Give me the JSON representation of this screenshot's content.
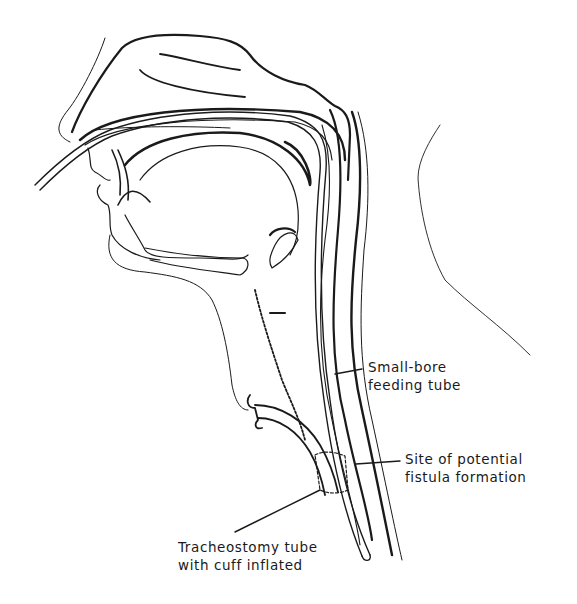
{
  "diagram": {
    "colors": {
      "ink": "#1a1a1a",
      "background": "#ffffff"
    },
    "labels": {
      "feeding_tube": {
        "line1": "Small-bore",
        "line2": "feeding tube"
      },
      "fistula_site": {
        "line1": "Site of potential",
        "line2": "fistula formation"
      },
      "tracheostomy": {
        "line1": "Tracheostomy tube",
        "line2": "with cuff inflated"
      }
    }
  }
}
